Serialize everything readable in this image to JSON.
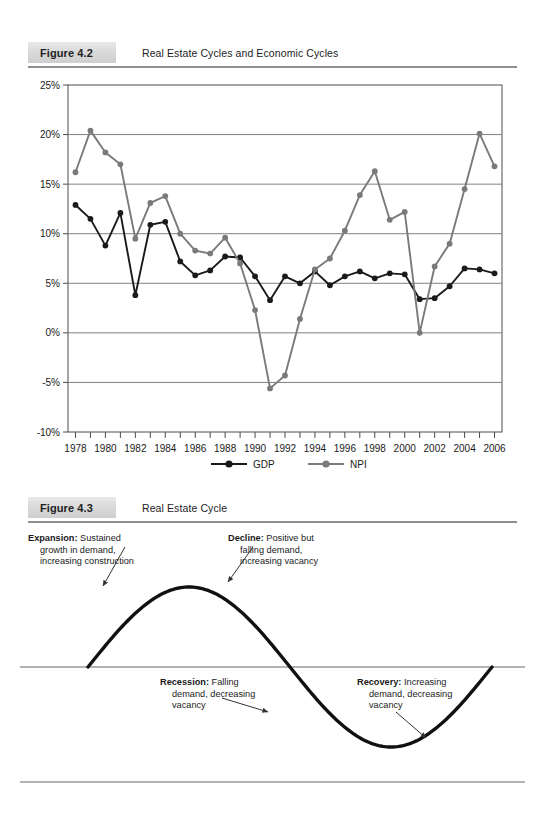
{
  "figure_4_2": {
    "tag": "Figure 4.2",
    "title": "Real Estate Cycles and Economic Cycles"
  },
  "figure_4_3": {
    "tag": "Figure 4.3",
    "title": "Real Estate Cycle",
    "annotations": {
      "expansion": {
        "line1_bold": "Expansion:",
        "line1_rest": " Sustained",
        "line2": "growth in demand,",
        "line3": "increasing construction"
      },
      "decline": {
        "line1_bold": "Decline:",
        "line1_rest": " Positive but",
        "line2": "falling demand,",
        "line3": "increasing vacancy"
      },
      "recession": {
        "line1_bold": "Recession:",
        "line1_rest": " Falling",
        "line2": "demand, decreasing",
        "line3": "vacancy"
      },
      "recovery": {
        "line1_bold": "Recovery:",
        "line1_rest": " Increasing",
        "line2": "demand, decreasing",
        "line3": "vacancy"
      }
    }
  },
  "chart_data": {
    "type": "line",
    "title": "Real Estate Cycles and Economic Cycles",
    "xlabel": "",
    "ylabel": "",
    "x": [
      1978,
      1979,
      1980,
      1981,
      1982,
      1983,
      1984,
      1985,
      1986,
      1987,
      1988,
      1989,
      1990,
      1991,
      1992,
      1993,
      1994,
      1995,
      1996,
      1997,
      1998,
      1999,
      2000,
      2001,
      2002,
      2003,
      2004,
      2005,
      2006
    ],
    "xlim": [
      1977.5,
      2006.5
    ],
    "ylim": [
      -10,
      25
    ],
    "ytick_labels": [
      "25%",
      "20%",
      "15%",
      "10%",
      "5%",
      "0%",
      "-5%",
      "-10%"
    ],
    "yticks": [
      25,
      20,
      15,
      10,
      5,
      0,
      -5,
      -10
    ],
    "xtick_labels": [
      "1978",
      "1980",
      "1982",
      "1984",
      "1986",
      "1988",
      "1990",
      "1992",
      "1994",
      "1996",
      "1998",
      "2000",
      "2002",
      "2004",
      "2006"
    ],
    "xticks": [
      1978,
      1980,
      1982,
      1984,
      1986,
      1988,
      1990,
      1992,
      1994,
      1996,
      1998,
      2000,
      2002,
      2004,
      2006
    ],
    "grid": true,
    "legend_position": "bottom",
    "series": [
      {
        "name": "GDP",
        "color": "#1a1a1a",
        "values": [
          12.9,
          11.5,
          8.8,
          12.1,
          3.8,
          10.9,
          11.2,
          7.2,
          5.8,
          6.3,
          7.7,
          7.6,
          5.7,
          3.3,
          5.7,
          5.0,
          6.2,
          4.8,
          5.7,
          6.2,
          5.5,
          6.0,
          5.9,
          3.4,
          3.5,
          4.7,
          6.5,
          6.4,
          6.0
        ]
      },
      {
        "name": "NPI",
        "color": "#7a7a7a",
        "values": [
          16.2,
          20.4,
          18.2,
          17.0,
          9.5,
          13.1,
          13.8,
          10.0,
          8.3,
          8.0,
          9.6,
          7.0,
          2.3,
          -5.6,
          -4.3,
          1.4,
          6.4,
          7.5,
          10.3,
          13.9,
          16.3,
          11.4,
          12.2,
          0.0,
          6.7,
          9.0,
          14.5,
          20.1,
          16.8
        ]
      }
    ]
  }
}
